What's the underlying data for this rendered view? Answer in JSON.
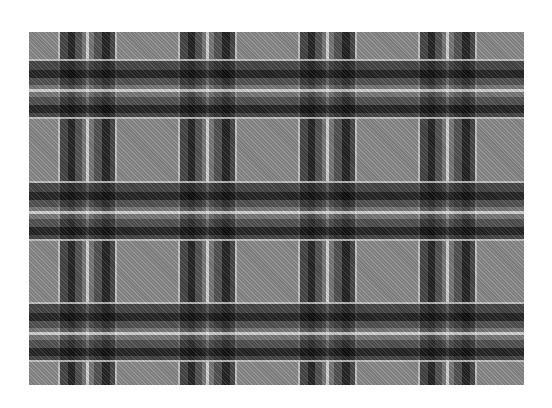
{
  "image": {
    "description": "Greyscale tartan plaid fabric pattern",
    "colors": {
      "background": "#ffffff",
      "base": "#8a8a8a",
      "dark_stripe": "#282828",
      "black_stripe": "#0a0a0a",
      "light_line": "#cdcdcd",
      "white_line": "#e6e6e6"
    },
    "sett": {
      "vertical_period_px": 120,
      "horizontal_period_px": 121.5,
      "vertical_groups": 4,
      "horizontal_bands": 3
    }
  }
}
